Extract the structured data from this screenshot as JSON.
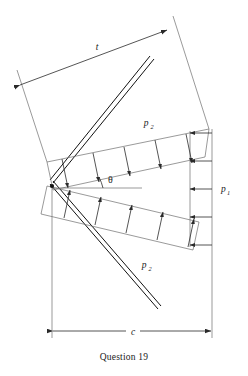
{
  "figure": {
    "caption": "Question 19",
    "labels": {
      "t": "t",
      "p1_base": "p",
      "p1_sub": "1",
      "p2_base": "p",
      "p2_sub": "2",
      "theta": "θ",
      "c": "c"
    },
    "dimensions": [
      {
        "name": "t",
        "label": "t",
        "orientation": "diagonal-upper-left",
        "arrows": "both-ends"
      },
      {
        "name": "p1",
        "label": "p1",
        "orientation": "vertical-right",
        "arrows": "left-pointing",
        "count": 5
      },
      {
        "name": "c",
        "label": "c",
        "orientation": "horizontal-bottom",
        "arrows": "both-ends"
      }
    ],
    "loads": [
      {
        "name": "p2-upper",
        "label": "p2",
        "arrow_count": 5,
        "direction": "toward-upper-arm"
      },
      {
        "name": "p2-lower",
        "label": "p2",
        "arrow_count": 5,
        "direction": "toward-lower-arm"
      },
      {
        "name": "p1-right",
        "label": "p1",
        "arrow_count": 5,
        "direction": "leftward"
      }
    ],
    "angle": {
      "name": "theta",
      "symbol": "θ",
      "between": "horizontal-axis and upper-load-band"
    },
    "colors": {
      "background": "#ffffff",
      "beam": "#111111",
      "thin_line": "#6f6f6f",
      "arrow": "#2a2a2a",
      "text": "#1a1a1a"
    }
  }
}
